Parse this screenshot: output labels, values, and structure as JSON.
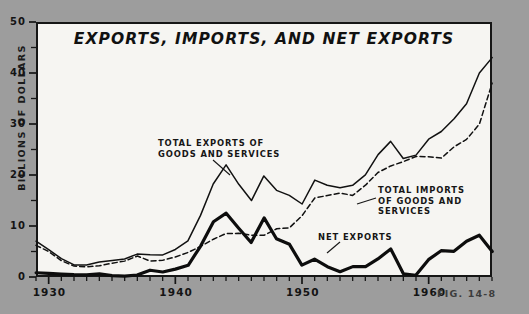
{
  "figure": {
    "number_label": "FIG. 14-8"
  },
  "chart_data": {
    "type": "line",
    "title": "EXPORTS, IMPORTS, AND NET EXPORTS",
    "xlabel": "",
    "ylabel": "BILLIONS OF DOLLARS",
    "xlim": [
      1929,
      1965
    ],
    "ylim": [
      0,
      50
    ],
    "grid": false,
    "legend_position": "inline-annotations",
    "y_ticks": [
      0,
      10,
      20,
      30,
      40,
      50
    ],
    "y_tick_labels": [
      "0",
      "10",
      "20",
      "30",
      "40",
      "50"
    ],
    "y_minor_tick_step": 5,
    "x_ticks": [
      1930,
      1940,
      1950,
      1960
    ],
    "x_tick_labels": [
      "1930",
      "1940",
      "1950",
      "1960"
    ],
    "x_minor_tick_step": 1,
    "annotations": [
      {
        "name": "total-exports",
        "text": "TOTAL EXPORTS OF\nGOODS AND SERVICES",
        "points_to_year": 1945
      },
      {
        "name": "total-imports",
        "text": "TOTAL IMPORTS\nOF GOODS AND\nSERVICES",
        "points_to_year": 1957
      },
      {
        "name": "net-exports",
        "text": "NET EXPORTS",
        "points_to_year": 1955
      }
    ],
    "x": [
      1929,
      1930,
      1931,
      1932,
      1933,
      1934,
      1935,
      1936,
      1937,
      1938,
      1939,
      1940,
      1941,
      1942,
      1943,
      1944,
      1945,
      1946,
      1947,
      1948,
      1949,
      1950,
      1951,
      1952,
      1953,
      1954,
      1955,
      1956,
      1957,
      1958,
      1959,
      1960,
      1961,
      1962,
      1963,
      1964,
      1965
    ],
    "series": [
      {
        "name": "TOTAL EXPORTS OF GOODS AND SERVICES",
        "style": "solid-thin",
        "color": "#111111",
        "values": [
          7.0,
          5.4,
          3.6,
          2.4,
          2.4,
          2.9,
          3.2,
          3.5,
          4.5,
          4.4,
          4.3,
          5.4,
          7.1,
          12.1,
          18.2,
          22.0,
          18.2,
          15.0,
          19.8,
          17.0,
          16.0,
          14.3,
          19.0,
          18.0,
          17.5,
          18.0,
          20.0,
          24.0,
          26.6,
          23.2,
          23.9,
          27.0,
          28.5,
          31.0,
          34.0,
          40.0,
          43.0
        ]
      },
      {
        "name": "TOTAL IMPORTS OF GOODS AND SERVICES",
        "style": "dashed",
        "color": "#111111",
        "values": [
          6.2,
          5.0,
          3.2,
          2.1,
          2.0,
          2.2,
          2.7,
          3.1,
          4.1,
          3.1,
          3.3,
          3.9,
          4.8,
          6.0,
          7.4,
          8.5,
          8.6,
          8.2,
          8.2,
          9.5,
          9.6,
          12.0,
          15.5,
          16.0,
          16.5,
          16.0,
          18.0,
          20.5,
          21.8,
          22.6,
          23.6,
          23.6,
          23.3,
          25.5,
          27.0,
          30.0,
          38.0
        ]
      },
      {
        "name": "NET EXPORTS",
        "style": "solid-thick",
        "color": "#0d0d0d",
        "values": [
          0.8,
          0.7,
          0.6,
          0.5,
          0.4,
          0.6,
          0.3,
          0.2,
          0.4,
          1.3,
          1.0,
          1.5,
          2.3,
          6.1,
          10.8,
          12.5,
          9.6,
          6.8,
          11.6,
          7.5,
          6.4,
          2.3,
          3.5,
          2.0,
          1.0,
          2.0,
          2.0,
          3.5,
          5.5,
          0.6,
          0.3,
          3.4,
          5.2,
          5.0,
          7.0,
          8.2,
          5.0
        ]
      }
    ]
  }
}
